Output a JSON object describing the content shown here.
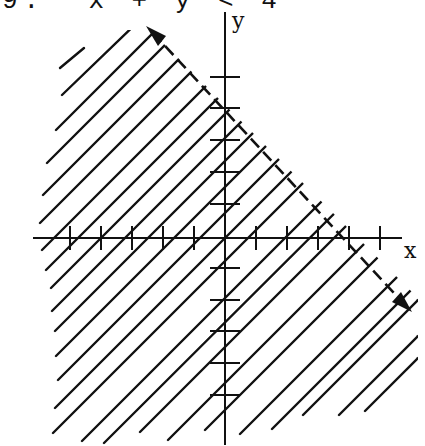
{
  "header": {
    "text": "9.  x + y < 4"
  },
  "axes": {
    "x_label": "x",
    "y_label": "y"
  },
  "graph": {
    "inequality": "x + y < 4",
    "boundary_line": "x + y = 4",
    "boundary_style": "dashed",
    "shaded_region": "below-left of boundary",
    "x_intercept": 4,
    "y_intercept": 4,
    "x_ticks": [
      -5,
      -4,
      -3,
      -2,
      -1,
      1,
      2,
      3,
      4,
      5
    ],
    "y_ticks": [
      -6,
      -5,
      -4,
      -3,
      -2,
      -1,
      1,
      2,
      3,
      4,
      5
    ],
    "ink_color": "#111111",
    "background_color": "#ffffff"
  }
}
